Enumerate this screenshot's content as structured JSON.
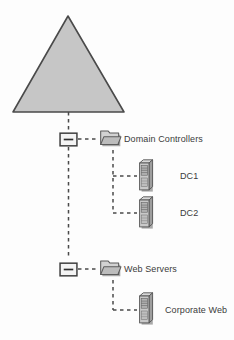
{
  "diagram": {
    "background_color": "#fdfdfd",
    "line_color": "#4a4a4a",
    "fill_gray": "#c6c6c6",
    "shadow_gray": "#b0b0b0",
    "text_color": "#3b3b3b",
    "root": {
      "icon": "domain-triangle-icon",
      "label": ""
    },
    "nodes": [
      {
        "id": "domain-controllers",
        "icon": "folder-icon",
        "expander": "minus-box-icon",
        "label": "Domain Controllers",
        "children": [
          {
            "id": "dc1",
            "icon": "server-icon",
            "label": "DC1"
          },
          {
            "id": "dc2",
            "icon": "server-icon",
            "label": "DC2"
          }
        ]
      },
      {
        "id": "web-servers",
        "icon": "folder-icon",
        "expander": "minus-box-icon",
        "label": "Web Servers",
        "children": [
          {
            "id": "corporate-web",
            "icon": "server-icon",
            "label": "Corporate Web"
          }
        ]
      }
    ]
  }
}
